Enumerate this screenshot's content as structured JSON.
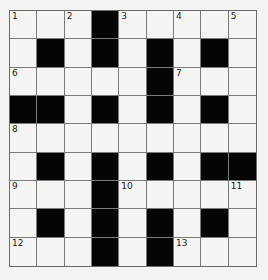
{
  "puzzle": {
    "rows": 9,
    "cols": 9,
    "layout": [
      "W W W B W W W W W",
      "W B W B W B W B W",
      "W W W W W B W W W",
      "B B W B W B W B W",
      "W W W W W W W W W",
      "W B W B W B W B B",
      "W W W B W W W W W",
      "W B W B W B W B W",
      "W W W B W B W W W"
    ],
    "numbers": [
      {
        "r": 0,
        "c": 0,
        "n": "1"
      },
      {
        "r": 0,
        "c": 2,
        "n": "2"
      },
      {
        "r": 0,
        "c": 4,
        "n": "3"
      },
      {
        "r": 0,
        "c": 6,
        "n": "4"
      },
      {
        "r": 0,
        "c": 8,
        "n": "5"
      },
      {
        "r": 2,
        "c": 0,
        "n": "6"
      },
      {
        "r": 2,
        "c": 6,
        "n": "7"
      },
      {
        "r": 4,
        "c": 0,
        "n": "8"
      },
      {
        "r": 6,
        "c": 0,
        "n": "9"
      },
      {
        "r": 6,
        "c": 4,
        "n": "10"
      },
      {
        "r": 6,
        "c": 8,
        "n": "11"
      },
      {
        "r": 8,
        "c": 0,
        "n": "12"
      },
      {
        "r": 8,
        "c": 6,
        "n": "13"
      }
    ]
  },
  "colors": {
    "black": "#050505",
    "white": "#f4f4f2",
    "line": "#7a7a7a"
  }
}
